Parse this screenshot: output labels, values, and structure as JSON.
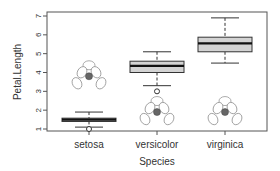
{
  "chart_data": {
    "type": "boxplot",
    "title": "",
    "xlabel": "Species",
    "ylabel": "Petal.Length",
    "categories": [
      "setosa",
      "versicolor",
      "virginica"
    ],
    "ylim": [
      0.85,
      7.2
    ],
    "yticks": [
      1,
      2,
      3,
      4,
      5,
      6,
      7
    ],
    "grid": false,
    "legend": null,
    "series": [
      {
        "name": "setosa",
        "whisker_low": 1.1,
        "q1": 1.4,
        "median": 1.5,
        "q3": 1.575,
        "whisker_high": 1.9,
        "outliers": [
          1.0
        ]
      },
      {
        "name": "versicolor",
        "whisker_low": 3.3,
        "q1": 4.0,
        "median": 4.35,
        "q3": 4.6,
        "whisker_high": 5.1,
        "outliers": [
          3.0
        ]
      },
      {
        "name": "virginica",
        "whisker_low": 4.5,
        "q1": 5.1,
        "median": 5.55,
        "q3": 5.875,
        "whisker_high": 6.9,
        "outliers": []
      }
    ],
    "annotations": [
      {
        "type": "flower-image",
        "category": "setosa",
        "y_center": 3.8
      },
      {
        "type": "flower-image",
        "category": "versicolor",
        "y_center": 1.9
      },
      {
        "type": "flower-image",
        "category": "virginica",
        "y_center": 1.9
      }
    ],
    "colors": {
      "box_fill": "#d3d3d3",
      "line": "#333333",
      "axis": "#555555"
    }
  },
  "labels": {
    "xlabel": "Species",
    "ylabel": "Petal.Length"
  }
}
